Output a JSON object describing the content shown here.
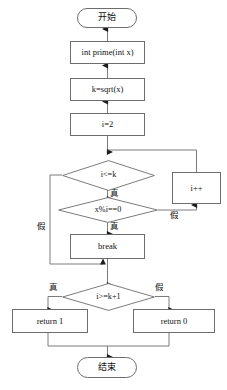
{
  "diagram": {
    "language": "zh-CN",
    "line_color": "#6d6d6d",
    "text_color": "#111111",
    "background": "#ffffff"
  },
  "nodes": {
    "start": {
      "label": "开始",
      "shape": "terminator"
    },
    "signature": {
      "label": "int prime(int x)",
      "shape": "process"
    },
    "sqrt": {
      "label": "k=sqrt(x)",
      "shape": "process"
    },
    "init": {
      "label": "i=2",
      "shape": "process"
    },
    "cond_loop": {
      "label": "i<=k",
      "shape": "decision"
    },
    "cond_mod": {
      "label": "x%i==0",
      "shape": "decision"
    },
    "break": {
      "label": "break",
      "shape": "process"
    },
    "increment": {
      "label": "i++",
      "shape": "process"
    },
    "cond_result": {
      "label": "i>=k+1",
      "shape": "decision"
    },
    "return_one": {
      "label": "return 1",
      "shape": "process"
    },
    "return_zero": {
      "label": "return 0",
      "shape": "process"
    },
    "end": {
      "label": "结束",
      "shape": "terminator"
    }
  },
  "edge_labels": {
    "loop_true": "真",
    "loop_false": "假",
    "mod_true": "真",
    "mod_false": "假",
    "result_true": "真",
    "result_false": "假"
  }
}
